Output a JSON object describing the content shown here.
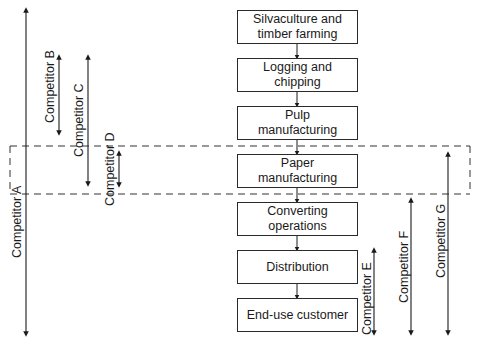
{
  "diagram": {
    "stages": [
      {
        "label_line1": "Silvaculture and",
        "label_line2": "timber farming"
      },
      {
        "label_line1": "Logging and",
        "label_line2": "chipping"
      },
      {
        "label_line1": "Pulp",
        "label_line2": "manufacturing"
      },
      {
        "label_line1": "Paper",
        "label_line2": "manufacturing"
      },
      {
        "label_line1": "Converting",
        "label_line2": "operations"
      },
      {
        "label_line1": "Distribution",
        "label_line2": ""
      },
      {
        "label_line1": "End-use customer",
        "label_line2": ""
      }
    ],
    "highlight_region": "Paper manufacturing (dashed box)",
    "competitors": [
      {
        "label": "Competitor A",
        "span": "Silvaculture to End-use customer"
      },
      {
        "label": "Competitor B",
        "span": "Logging to Pulp"
      },
      {
        "label": "Competitor C",
        "span": "Logging to Paper"
      },
      {
        "label": "Competitor D",
        "span": "Paper only"
      },
      {
        "label": "Competitor E",
        "span": "Distribution to End-use customer"
      },
      {
        "label": "Competitor F",
        "span": "Converting to End-use customer"
      },
      {
        "label": "Competitor G",
        "span": "Paper to End-use customer"
      }
    ]
  }
}
